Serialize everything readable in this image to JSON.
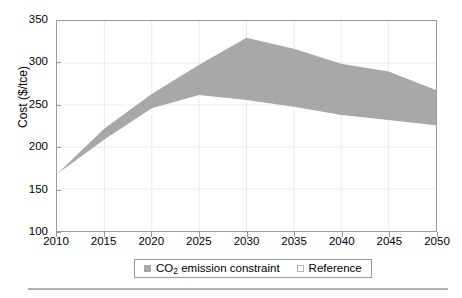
{
  "chart_data": {
    "type": "area",
    "title": "",
    "subtitle": "",
    "xlabel": "",
    "ylabel": "Cost ($/tce)",
    "ylabel_prefix": "Cost ($/tce)",
    "xlim": [
      2010,
      2050
    ],
    "ylim": [
      100,
      350
    ],
    "grid": true,
    "legend_position": "bottom-center",
    "x": [
      2010,
      2015,
      2020,
      2025,
      2030,
      2035,
      2040,
      2045,
      2050
    ],
    "series": [
      {
        "name": "CO2 emission constraint",
        "role": "band-upper",
        "values": [
          168,
          222,
          263,
          298,
          330,
          317,
          299,
          290,
          268
        ]
      },
      {
        "name": "Reference",
        "role": "band-lower",
        "values": [
          168,
          209,
          246,
          262,
          256,
          248,
          238,
          232,
          226
        ]
      }
    ],
    "band_fill_color": "#a8a8a8",
    "axis_color": "#9a9a9a",
    "grid_color": "#ebebeb",
    "background_color": "#ffffff",
    "x_ticks": [
      "2010",
      "2015",
      "2020",
      "2025",
      "2030",
      "2035",
      "2040",
      "2045",
      "2050"
    ],
    "y_ticks": [
      "100",
      "150",
      "200",
      "250",
      "300",
      "350"
    ],
    "annotations": []
  },
  "axes": {
    "y_title_main": "Cost ($/tce)",
    "x_ticks": [
      {
        "label": "2010",
        "value": 2010
      },
      {
        "label": "2015",
        "value": 2015
      },
      {
        "label": "2020",
        "value": 2020
      },
      {
        "label": "2025",
        "value": 2025
      },
      {
        "label": "2030",
        "value": 2030
      },
      {
        "label": "2035",
        "value": 2035
      },
      {
        "label": "2040",
        "value": 2040
      },
      {
        "label": "2045",
        "value": 2045
      },
      {
        "label": "2050",
        "value": 2050
      }
    ],
    "y_ticks": [
      {
        "label": "350",
        "value": 350
      },
      {
        "label": "300",
        "value": 300
      },
      {
        "label": "250",
        "value": 250
      },
      {
        "label": "200",
        "value": 200
      },
      {
        "label": "150",
        "value": 150
      },
      {
        "label": "100",
        "value": 100
      }
    ]
  },
  "legend": {
    "items": [
      {
        "label_pre": "CO",
        "label_sub": "2",
        "label_post": " emission constraint",
        "swatch": "filled",
        "color": "#a8a8a8"
      },
      {
        "label_pre": "Reference",
        "label_sub": "",
        "label_post": "",
        "swatch": "hollow",
        "color": "#ffffff"
      }
    ]
  }
}
